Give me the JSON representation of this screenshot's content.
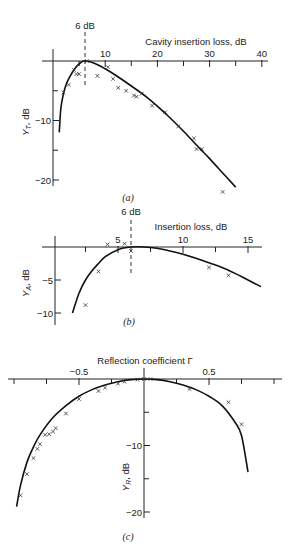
{
  "chart_data": [
    {
      "id": "a",
      "type": "scatter",
      "caption": "(a)",
      "title": "",
      "xlabel": "Cavity insertion loss, dB",
      "ylabel": "Y_T, dB",
      "annotation": "6 dB",
      "annotation_x": 6,
      "xlim": [
        0,
        40
      ],
      "ylim": [
        -22,
        0
      ],
      "x_ticks": [
        10,
        20,
        30,
        40
      ],
      "y_ticks": [
        -10,
        -20
      ],
      "grid": false,
      "series": [
        {
          "name": "theory",
          "kind": "line",
          "x": [
            1.2,
            1.5,
            2,
            2.5,
            3,
            4,
            5,
            6,
            8,
            10,
            12,
            15,
            18,
            20,
            22,
            25,
            28,
            30,
            33,
            35
          ],
          "y": [
            -12,
            -8,
            -5.5,
            -4,
            -3,
            -1.5,
            -0.5,
            0,
            -0.4,
            -1.3,
            -2.4,
            -4.2,
            -6.1,
            -7.6,
            -9.2,
            -11.8,
            -14.6,
            -16.4,
            -19.3,
            -21.2
          ]
        },
        {
          "name": "measured",
          "kind": "scatter",
          "x": [
            2,
            3,
            4,
            4.5,
            5,
            6.5,
            8.5,
            10.5,
            11.5,
            12.5,
            14,
            15.5,
            16,
            17,
            19,
            21.5,
            24,
            27,
            27.5,
            28.5,
            32.5
          ],
          "y": [
            -5.3,
            -4,
            -1.5,
            -2.2,
            -2.2,
            0,
            -2.5,
            -1,
            -3,
            -4.5,
            -5,
            -5.8,
            -6,
            -5.5,
            -7.5,
            -8.6,
            -11,
            -13,
            -14.8,
            -14.8,
            -22
          ]
        }
      ]
    },
    {
      "id": "b",
      "type": "scatter",
      "caption": "(b)",
      "xlabel": "Insertion loss, dB",
      "ylabel": "Y_A, dB",
      "annotation": "6 dB",
      "annotation_x": 6,
      "xlim": [
        0,
        16
      ],
      "ylim": [
        -11,
        0
      ],
      "x_ticks": [
        5,
        10,
        15
      ],
      "y_ticks": [
        -5,
        -10
      ],
      "grid": false,
      "series": [
        {
          "name": "theory",
          "kind": "line",
          "x": [
            1.5,
            2,
            2.5,
            3,
            3.5,
            4,
            5,
            6,
            7,
            8,
            9,
            10,
            11,
            12,
            13,
            14,
            15,
            16
          ],
          "y": [
            -10,
            -7,
            -5,
            -3.6,
            -2.5,
            -1.5,
            -0.4,
            0,
            0,
            -0.2,
            -0.6,
            -1.1,
            -1.7,
            -2.4,
            -3.1,
            -4.0,
            -5.0,
            -6.0
          ]
        },
        {
          "name": "measured",
          "kind": "scatter",
          "x": [
            2.5,
            3.5,
            4.2,
            5.5,
            6,
            12,
            13.5
          ],
          "y": [
            -8.8,
            -3.7,
            0.4,
            0.5,
            -0.6,
            -3.1,
            -4.3
          ]
        }
      ]
    },
    {
      "id": "c",
      "type": "scatter",
      "caption": "(c)",
      "xlabel": "Reflection coefficient Γ",
      "ylabel": "Y_R, dB",
      "xlim": [
        -1,
        1
      ],
      "ylim": [
        -21,
        0
      ],
      "x_ticks": [
        -0.5,
        0.5
      ],
      "y_ticks": [
        -10,
        -20
      ],
      "grid": false,
      "series": [
        {
          "name": "theory",
          "kind": "line",
          "x": [
            -0.98,
            -0.95,
            -0.9,
            -0.85,
            -0.8,
            -0.7,
            -0.6,
            -0.5,
            -0.4,
            -0.3,
            -0.2,
            -0.1,
            0,
            0.1,
            0.2,
            0.3,
            0.4,
            0.5,
            0.6,
            0.7,
            0.75,
            0.8
          ],
          "y": [
            -19.2,
            -16,
            -12.5,
            -10.2,
            -8.4,
            -5.8,
            -4,
            -2.6,
            -1.6,
            -0.9,
            -0.4,
            -0.1,
            0,
            -0.1,
            -0.4,
            -0.9,
            -1.6,
            -2.6,
            -4,
            -6.5,
            -8.5,
            -14
          ]
        },
        {
          "name": "measured",
          "kind": "scatter",
          "x": [
            -0.95,
            -0.9,
            -0.85,
            -0.82,
            -0.8,
            -0.76,
            -0.73,
            -0.7,
            -0.68,
            -0.6,
            -0.5,
            -0.35,
            -0.3,
            -0.2,
            -0.15,
            -0.05,
            0,
            0.05,
            0.35,
            0.65,
            0.75
          ],
          "y": [
            -17.5,
            -14.3,
            -11.9,
            -10.5,
            -9.8,
            -8.4,
            -8.3,
            -7.9,
            -7.4,
            -5.2,
            -3,
            -1.8,
            -1.3,
            -0.7,
            -0.4,
            -0.1,
            0,
            0,
            -1.5,
            -3.5,
            -6.8
          ]
        }
      ]
    }
  ],
  "labels": {
    "a": {
      "annotation": "6 dB",
      "xlabel": "Cavity insertion loss, dB",
      "ylabel": "Y",
      "ysub": "T",
      "yunit": ", dB",
      "xticks": [
        "10",
        "20",
        "30",
        "40"
      ],
      "yticks": [
        "−10",
        "−20"
      ],
      "caption": "(a)"
    },
    "b": {
      "annotation": "6 dB",
      "xlabel": "Insertion loss, dB",
      "ylabel": "Y",
      "ysub": "A",
      "yunit": ", dB",
      "xticks": [
        "5",
        "10",
        "15"
      ],
      "yticks": [
        "−5",
        "−10"
      ],
      "caption": "(b)"
    },
    "c": {
      "xlabel": "Reflection coefficient Γ",
      "ylabel": "Y",
      "ysub": "R",
      "yunit": ", dB",
      "xticks": [
        "−0.5",
        "0.5"
      ],
      "yticks": [
        "−10",
        "−20"
      ],
      "caption": "(c)"
    }
  }
}
